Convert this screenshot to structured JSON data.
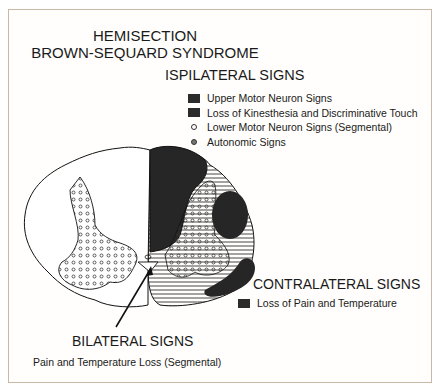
{
  "title": {
    "line1": "HEMISECTION",
    "line2": "BROWN-SEQUARD SYNDROME"
  },
  "ipsilateral": {
    "heading": "ISPILATERAL SIGNS",
    "items": [
      {
        "label": "Upper Motor Neuron Signs",
        "marker": "dark-square"
      },
      {
        "label": "Loss of Kinesthesia and Discriminative Touch",
        "marker": "dark-square"
      },
      {
        "label": "Lower Motor Neuron Signs (Segmental)",
        "marker": "open-circle"
      },
      {
        "label": "Autonomic Signs",
        "marker": "small-circle"
      }
    ]
  },
  "contralateral": {
    "heading": "CONTRALATERAL SIGNS",
    "items": [
      {
        "label": "Loss of Pain and Temperature",
        "marker": "dark-square"
      }
    ]
  },
  "bilateral": {
    "heading": "BILATERAL SIGNS",
    "subtitle": "Pain and Temperature Loss (Segmental)"
  },
  "colors": {
    "lesion_fill": "#262626",
    "outline": "#111111",
    "hatch": "#333333",
    "frame_border": "#c9b8a6"
  }
}
